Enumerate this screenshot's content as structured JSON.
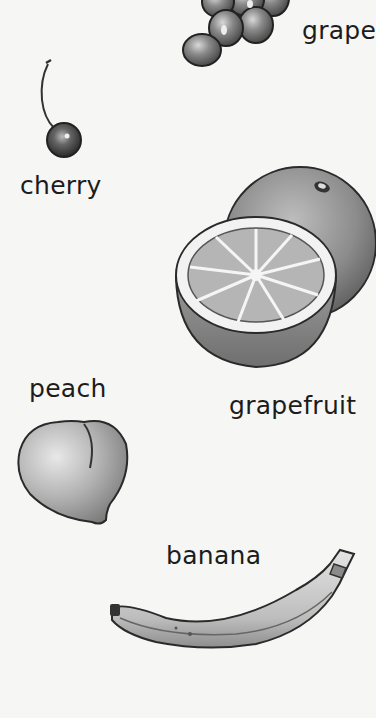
{
  "page": {
    "background": "#f6f6f4",
    "ink_color": "#1c1c1c",
    "items": [
      {
        "id": "grape",
        "label": "grape",
        "icon": "grapes-illustration"
      },
      {
        "id": "cherry",
        "label": "cherry",
        "icon": "cherry-illustration"
      },
      {
        "id": "grapefruit",
        "label": "grapefruit",
        "icon": "grapefruit-illustration"
      },
      {
        "id": "peach",
        "label": "peach",
        "icon": "peach-illustration"
      },
      {
        "id": "banana",
        "label": "banana",
        "icon": "banana-illustration"
      }
    ]
  }
}
